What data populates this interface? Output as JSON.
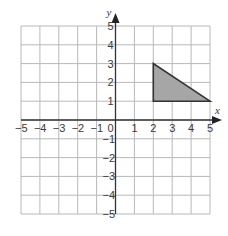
{
  "diagram": {
    "type": "coordinate-plane",
    "axes": {
      "x_label": "x",
      "y_label": "y",
      "x_range": [
        -5,
        5
      ],
      "y_range": [
        -5,
        5
      ],
      "x_ticks": [
        "−5",
        "−4",
        "−3",
        "−2",
        "−1",
        "0",
        "1",
        "2",
        "3",
        "4",
        "5"
      ],
      "y_ticks": [
        "5",
        "4",
        "3",
        "2",
        "1",
        "−1",
        "−2",
        "−3",
        "−4",
        "−5"
      ]
    },
    "grid": {
      "step": 1,
      "color": "#b8b8b8"
    },
    "shape": {
      "kind": "triangle",
      "vertices": [
        [
          2,
          3
        ],
        [
          2,
          1
        ],
        [
          5,
          1
        ]
      ],
      "fill": "#a6a6a6",
      "stroke": "#333333"
    }
  }
}
